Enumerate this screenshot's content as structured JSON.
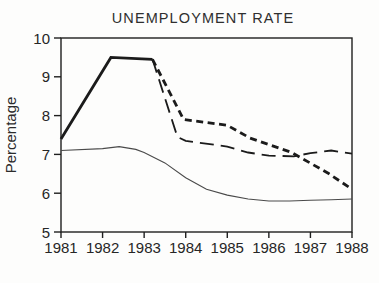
{
  "chart_data": {
    "type": "line",
    "title": "UNEMPLOYMENT RATE",
    "xlabel": "",
    "ylabel": "Percentage",
    "xlim": [
      1981,
      1988
    ],
    "ylim": [
      5,
      10
    ],
    "x_ticks": [
      "1981",
      "1982",
      "1983",
      "1984",
      "1985",
      "1986",
      "1987",
      "1988"
    ],
    "y_ticks": [
      "5",
      "6",
      "7",
      "8",
      "9",
      "10"
    ],
    "grid": false,
    "legend": "none",
    "frame": "full-box",
    "colors": {
      "axis": "#1f1f1f",
      "text": "#2b2b2b",
      "line_bold": "#1b1b1b",
      "line_thin": "#4a4a4a",
      "background": "#fdfdfc"
    },
    "series": [
      {
        "name": "thick-solid",
        "style": "solid-thick",
        "points": [
          [
            1981,
            7.4
          ],
          [
            1982.2,
            9.5
          ],
          [
            1983.2,
            9.45
          ]
        ]
      },
      {
        "name": "bold-short-dash",
        "style": "short-dash",
        "points": [
          [
            1983.2,
            9.45
          ],
          [
            1983.95,
            7.9
          ],
          [
            1985,
            7.75
          ],
          [
            1985.55,
            7.42
          ],
          [
            1986.55,
            7.05
          ],
          [
            1987.45,
            6.5
          ],
          [
            1988,
            6.1
          ]
        ]
      },
      {
        "name": "long-dash",
        "style": "long-dash",
        "points": [
          [
            1983.2,
            9.45
          ],
          [
            1983.8,
            7.45
          ],
          [
            1984,
            7.35
          ],
          [
            1985,
            7.2
          ],
          [
            1985.5,
            7.05
          ],
          [
            1986,
            6.97
          ],
          [
            1986.6,
            6.95
          ],
          [
            1987,
            7.03
          ],
          [
            1987.5,
            7.1
          ],
          [
            1988,
            7.02
          ]
        ]
      },
      {
        "name": "thin-solid",
        "style": "solid-thin",
        "points": [
          [
            1981,
            7.1
          ],
          [
            1982,
            7.15
          ],
          [
            1982.4,
            7.2
          ],
          [
            1982.8,
            7.13
          ],
          [
            1983,
            7.05
          ],
          [
            1983.5,
            6.78
          ],
          [
            1984,
            6.4
          ],
          [
            1984.5,
            6.1
          ],
          [
            1985,
            5.95
          ],
          [
            1985.5,
            5.85
          ],
          [
            1986,
            5.8
          ],
          [
            1986.5,
            5.8
          ],
          [
            1987,
            5.82
          ],
          [
            1987.5,
            5.83
          ],
          [
            1988,
            5.85
          ]
        ]
      }
    ]
  }
}
